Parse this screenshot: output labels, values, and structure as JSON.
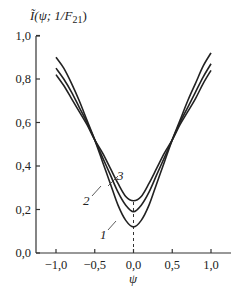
{
  "chart_data": {
    "type": "line",
    "title": "",
    "ylabel": "Ĩ(ψ; 1/F21)",
    "xlabel": "ψ",
    "xlim": [
      -1.25,
      1.25
    ],
    "ylim": [
      0.0,
      1.0
    ],
    "grid": false,
    "legend": "none (curves labelled inline 1, 2, 3)",
    "x_ticks": [
      -1.0,
      -0.5,
      0.0,
      0.5,
      1.0
    ],
    "x_tick_labels": [
      "−1,0",
      "−0,5",
      "0,0",
      "0,5",
      "1,0"
    ],
    "y_ticks": [
      0.0,
      0.2,
      0.4,
      0.6,
      0.8,
      1.0
    ],
    "y_tick_labels": [
      "0,0",
      "0,2",
      "0,4",
      "0,6",
      "0,8",
      "1,0"
    ],
    "x": [
      -1.0,
      -0.9,
      -0.8,
      -0.7,
      -0.6,
      -0.5,
      -0.4,
      -0.3,
      -0.2,
      -0.1,
      0.0,
      0.1,
      0.2,
      0.3,
      0.4,
      0.5,
      0.6,
      0.7,
      0.8,
      0.9,
      1.0
    ],
    "series": [
      {
        "name": "1",
        "values": [
          0.9,
          0.85,
          0.78,
          0.7,
          0.61,
          0.52,
          0.42,
          0.32,
          0.22,
          0.15,
          0.12,
          0.15,
          0.22,
          0.32,
          0.42,
          0.52,
          0.61,
          0.7,
          0.78,
          0.86,
          0.92
        ]
      },
      {
        "name": "2",
        "values": [
          0.85,
          0.8,
          0.74,
          0.67,
          0.6,
          0.52,
          0.44,
          0.36,
          0.28,
          0.22,
          0.19,
          0.22,
          0.28,
          0.36,
          0.44,
          0.52,
          0.6,
          0.67,
          0.74,
          0.81,
          0.87
        ]
      },
      {
        "name": "3",
        "values": [
          0.82,
          0.77,
          0.71,
          0.65,
          0.59,
          0.52,
          0.46,
          0.39,
          0.32,
          0.26,
          0.24,
          0.26,
          0.32,
          0.39,
          0.46,
          0.52,
          0.59,
          0.65,
          0.71,
          0.78,
          0.84
        ]
      }
    ],
    "annotations": [
      {
        "text": "1",
        "points_to_series": "1"
      },
      {
        "text": "2",
        "points_to_series": "2"
      },
      {
        "text": "3",
        "points_to_series": "3"
      },
      {
        "text": "dashed vertical line at ψ = 0 from axis to curve 3 minimum"
      }
    ]
  },
  "labels": {
    "y_axis_title_main": "Ĩ(ψ; 1/F",
    "y_axis_title_sub": "21",
    "y_axis_title_close": ")",
    "x_axis_title": "ψ",
    "curve_1": "1",
    "curve_2": "2",
    "curve_3": "3"
  }
}
